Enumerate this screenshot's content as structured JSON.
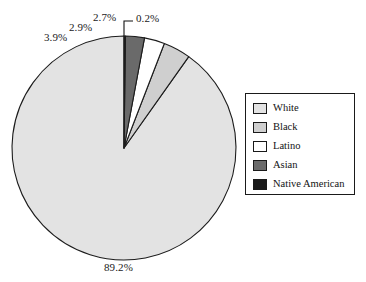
{
  "chart_data": {
    "type": "pie",
    "title": "",
    "subtitle": "",
    "xlabel": "",
    "ylabel": "",
    "grid": false,
    "legend_position": "right",
    "start_angle_deg": 0,
    "direction": "counterclockwise",
    "categories": [
      "White",
      "Black",
      "Latino",
      "Asian",
      "Native American"
    ],
    "values": [
      89.2,
      3.9,
      2.9,
      2.7,
      0.2
    ],
    "value_labels": [
      "89.2%",
      "3.9%",
      "2.9%",
      "2.7%",
      "0.2%"
    ],
    "colors": [
      "#e3e3e3",
      "#cfcfcf",
      "#ffffff",
      "#6a6a6a",
      "#1a1a1a"
    ],
    "slice_edge_color": "#1c1c1c",
    "annotations": [
      {
        "text": "89.2%",
        "target": "White",
        "has_leader": false
      },
      {
        "text": "3.9%",
        "target": "Black",
        "has_leader": false
      },
      {
        "text": "2.9%",
        "target": "Latino",
        "has_leader": false
      },
      {
        "text": "2.7%",
        "target": "Asian",
        "has_leader": false
      },
      {
        "text": "0.2%",
        "target": "Native American",
        "has_leader": true
      }
    ]
  },
  "pie": {
    "center_x": 124,
    "center_y": 148,
    "radius": 112,
    "slices": [
      {
        "name": "White",
        "label": "89.2%",
        "value": 89.2,
        "color": "#e3e3e3"
      },
      {
        "name": "Black",
        "label": "3.9%",
        "value": 3.9,
        "color": "#cfcfcf"
      },
      {
        "name": "Latino",
        "label": "2.9%",
        "value": 2.9,
        "color": "#ffffff"
      },
      {
        "name": "Asian",
        "label": "2.7%",
        "value": 2.7,
        "color": "#6a6a6a"
      },
      {
        "name": "Native American",
        "label": "0.2%",
        "value": 0.2,
        "color": "#1a1a1a"
      }
    ]
  },
  "labels": {
    "white_pct": "89.2%",
    "black_pct": "3.9%",
    "latino_pct": "2.9%",
    "asian_pct": "2.7%",
    "native_american_pct": "0.2%"
  },
  "legend": {
    "items": [
      {
        "label": "White",
        "color": "#e3e3e3"
      },
      {
        "label": "Black",
        "color": "#cfcfcf"
      },
      {
        "label": "Latino",
        "color": "#ffffff"
      },
      {
        "label": "Asian",
        "color": "#6a6a6a"
      },
      {
        "label": "Native American",
        "color": "#1a1a1a"
      }
    ]
  }
}
